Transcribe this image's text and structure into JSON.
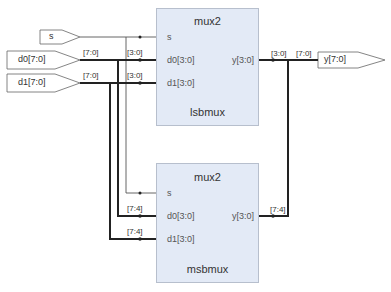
{
  "diagram": {
    "type": "rtl-schematic",
    "colors": {
      "block_fill": "#e3eaf6",
      "block_border": "#b7bfcd",
      "wire": "#222222",
      "thin_wire": "#555555"
    },
    "inputs": [
      {
        "id": "s",
        "label": "s"
      },
      {
        "id": "d0",
        "label": "d0[7:0]"
      },
      {
        "id": "d1",
        "label": "d1[7:0]"
      }
    ],
    "outputs": [
      {
        "id": "y",
        "label": "y[7:0]"
      }
    ],
    "blocks": [
      {
        "id": "lsbmux",
        "type": "mux2",
        "name": "lsbmux",
        "pins_in": [
          "s",
          "d0[3:0]",
          "d1[3:0]"
        ],
        "pin_out": "y[3:0]"
      },
      {
        "id": "msbmux",
        "type": "mux2",
        "name": "msbmux",
        "pins_in": [
          "s",
          "d0[3:0]",
          "d1[3:0]"
        ],
        "pin_out": "y[3:0]"
      }
    ],
    "bus_labels": {
      "d0_in": "[7:0]",
      "d1_in": "[7:0]",
      "lsb_d0": "[3:0]",
      "lsb_d1": "[3:0]",
      "msb_d0": "[7:4]",
      "msb_d1": "[7:4]",
      "lsb_y": "[3:0]",
      "y_out": "[7:0]",
      "msb_y": "[7:4]"
    }
  }
}
